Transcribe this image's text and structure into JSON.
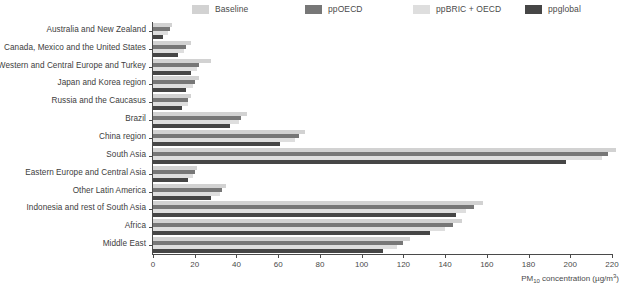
{
  "legend": {
    "position": "top",
    "items": [
      {
        "label": "Baseline",
        "color": "#d2d2d2"
      },
      {
        "label": "ppOECD",
        "color": "#777777"
      },
      {
        "label": "ppBRIC + OECD",
        "color": "#dedede"
      },
      {
        "label": "ppglobal",
        "color": "#464646"
      }
    ]
  },
  "axis": {
    "x_title_main": "PM",
    "x_title_sub": "10",
    "x_title_rest": " concentration (µg/m",
    "x_title_sup": "3",
    "x_title_end": ")",
    "x_title_full": "PM10 concentration (µg/m3)",
    "ticks": [
      "0",
      "20",
      "40",
      "60",
      "80",
      "100",
      "120",
      "140",
      "160",
      "180",
      "200",
      "220"
    ]
  },
  "chart_data": {
    "type": "bar",
    "orientation": "horizontal",
    "title": "",
    "xlabel": "PM10 concentration (µg/m3)",
    "ylabel": "",
    "xlim": [
      0,
      220
    ],
    "xtick_step": 20,
    "grid": false,
    "legend_position": "top",
    "categories": [
      "Australia and New Zealand",
      "Canada, Mexico and the United States",
      "Western and Central Europe and Turkey",
      "Japan and Korea region",
      "Russia and the Caucasus",
      "Brazil",
      "China region",
      "South Asia",
      "Eastern Europe and Central Asia",
      "Other Latin America",
      "Indonesia and rest of South Asia",
      "Africa",
      "Middle East"
    ],
    "series": [
      {
        "name": "Baseline",
        "color": "#d2d2d2",
        "values": [
          9,
          18,
          28,
          22,
          18,
          45,
          73,
          222,
          21,
          35,
          158,
          148,
          123
        ]
      },
      {
        "name": "ppOECD",
        "color": "#777777",
        "values": [
          8,
          16,
          22,
          20,
          17,
          42,
          70,
          218,
          20,
          33,
          154,
          144,
          120
        ]
      },
      {
        "name": "ppBRIC + OECD",
        "color": "#dedede",
        "values": [
          7,
          15,
          21,
          19,
          17,
          41,
          68,
          215,
          19,
          32,
          150,
          140,
          117
        ]
      },
      {
        "name": "ppglobal",
        "color": "#464646",
        "values": [
          5,
          12,
          18,
          16,
          14,
          37,
          61,
          198,
          17,
          28,
          145,
          133,
          110
        ]
      }
    ]
  }
}
